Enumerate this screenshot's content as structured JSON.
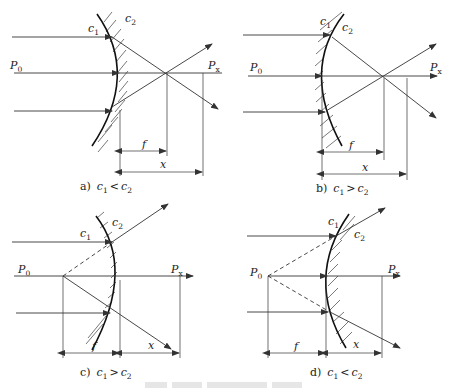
{
  "panels": [
    {
      "id": "a",
      "caption_prefix": "a)",
      "relation": "<",
      "c1": "c",
      "c1_sub": "1",
      "c2": "c",
      "c2_sub": "2",
      "p0": "P",
      "p0_sub": "0",
      "px": "P",
      "px_sub": "x",
      "f": "f",
      "x": "x"
    },
    {
      "id": "b",
      "caption_prefix": "b)",
      "relation": ">",
      "c1": "c",
      "c1_sub": "1",
      "c2": "c",
      "c2_sub": "2",
      "p0": "P",
      "p0_sub": "0",
      "px": "P",
      "px_sub": "x",
      "f": "f",
      "x": "x"
    },
    {
      "id": "c",
      "caption_prefix": "c)",
      "relation": ">",
      "c1": "c",
      "c1_sub": "1",
      "c2": "c",
      "c2_sub": "2",
      "p0": "P",
      "p0_sub": "0",
      "px": "P",
      "px_sub": "x",
      "f": "f",
      "x": "x"
    },
    {
      "id": "d",
      "caption_prefix": "d)",
      "relation": "<",
      "c1": "c",
      "c1_sub": "1",
      "c2": "c",
      "c2_sub": "2",
      "p0": "P",
      "p0_sub": "0",
      "px": "P",
      "px_sub": "x",
      "f": "f",
      "x": "x"
    }
  ]
}
